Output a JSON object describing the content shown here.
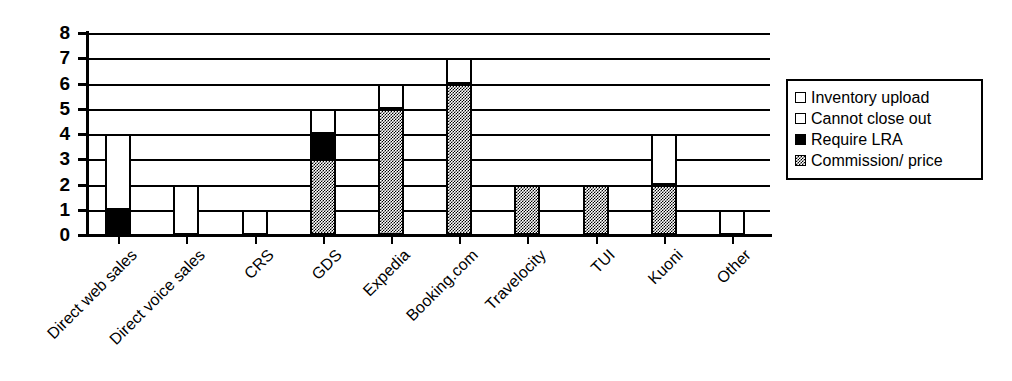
{
  "chart_data": {
    "type": "bar",
    "subtype": "stacked-bar",
    "title": "",
    "subtitle": "",
    "xlabel": "",
    "ylabel": "",
    "ylim": [
      0,
      8
    ],
    "ytick_labels": [
      "0",
      "1",
      "2",
      "3",
      "4",
      "5",
      "6",
      "7",
      "8"
    ],
    "ytick_values": [
      0,
      1,
      2,
      3,
      4,
      5,
      6,
      7,
      8
    ],
    "grid": true,
    "grid_axis": "y",
    "legend_position": "right",
    "categories": [
      "Direct web sales",
      "Direct voice sales",
      "CRS",
      "GDS",
      "Expedia",
      "Booking.com",
      "Travelocity",
      "TUI",
      "Kuoni",
      "Other"
    ],
    "series": [
      {
        "name": "Commission/ price",
        "fill": "gray",
        "color": "#808080",
        "values": [
          0,
          0,
          0,
          3,
          5,
          6,
          2,
          2,
          2,
          0
        ]
      },
      {
        "name": "Require LRA",
        "fill": "black",
        "color": "#000000",
        "values": [
          1,
          0,
          0,
          1,
          0,
          0,
          0,
          0,
          0,
          0
        ]
      },
      {
        "name": "Cannot close out",
        "fill": "white",
        "color": "#ffffff",
        "values": [
          0,
          0,
          0,
          0,
          0,
          0,
          0,
          0,
          0,
          0
        ]
      },
      {
        "name": "Inventory upload",
        "fill": "white",
        "color": "#ffffff",
        "values": [
          3,
          2,
          1,
          1,
          1,
          1,
          0,
          0,
          2,
          1
        ]
      }
    ],
    "totals": [
      4,
      2,
      1,
      5,
      6,
      7,
      2,
      2,
      4,
      1
    ],
    "stacks": [
      {
        "category": "Direct web sales",
        "segments": [
          {
            "series": "Require LRA",
            "fill": "black",
            "from": 0,
            "to": 1
          },
          {
            "series": "Inventory upload",
            "fill": "white",
            "from": 1,
            "to": 4
          }
        ]
      },
      {
        "category": "Direct voice sales",
        "segments": [
          {
            "series": "Inventory upload",
            "fill": "white",
            "from": 0,
            "to": 2
          }
        ]
      },
      {
        "category": "CRS",
        "segments": [
          {
            "series": "Inventory upload",
            "fill": "white",
            "from": 0,
            "to": 1
          }
        ]
      },
      {
        "category": "GDS",
        "segments": [
          {
            "series": "Commission/ price",
            "fill": "gray",
            "from": 0,
            "to": 3
          },
          {
            "series": "Require LRA",
            "fill": "black",
            "from": 3,
            "to": 4
          },
          {
            "series": "Inventory upload",
            "fill": "white",
            "from": 4,
            "to": 5
          }
        ]
      },
      {
        "category": "Expedia",
        "segments": [
          {
            "series": "Commission/ price",
            "fill": "gray",
            "from": 0,
            "to": 5
          },
          {
            "series": "Inventory upload",
            "fill": "white",
            "from": 5,
            "to": 6
          }
        ]
      },
      {
        "category": "Booking.com",
        "segments": [
          {
            "series": "Commission/ price",
            "fill": "gray",
            "from": 0,
            "to": 6
          },
          {
            "series": "Inventory upload",
            "fill": "white",
            "from": 6,
            "to": 7
          }
        ]
      },
      {
        "category": "Travelocity",
        "segments": [
          {
            "series": "Commission/ price",
            "fill": "gray",
            "from": 0,
            "to": 2
          }
        ]
      },
      {
        "category": "TUI",
        "segments": [
          {
            "series": "Commission/ price",
            "fill": "gray",
            "from": 0,
            "to": 2
          }
        ]
      },
      {
        "category": "Kuoni",
        "segments": [
          {
            "series": "Commission/ price",
            "fill": "gray",
            "from": 0,
            "to": 2
          },
          {
            "series": "Inventory upload",
            "fill": "white",
            "from": 2,
            "to": 4
          }
        ]
      },
      {
        "category": "Other",
        "segments": [
          {
            "series": "Inventory upload",
            "fill": "white",
            "from": 0,
            "to": 1
          }
        ]
      }
    ]
  },
  "legend": {
    "items": [
      {
        "label": "Inventory upload",
        "fill": "white"
      },
      {
        "label": "Cannot close out",
        "fill": "white"
      },
      {
        "label": "Require LRA",
        "fill": "black"
      },
      {
        "label": "Commission/ price",
        "fill": "gray"
      }
    ]
  },
  "colors": {
    "axis": "#000000",
    "grid": "#000000",
    "background": "#ffffff",
    "white_fill": "#ffffff",
    "black_fill": "#000000",
    "gray_fill": "#808080"
  }
}
